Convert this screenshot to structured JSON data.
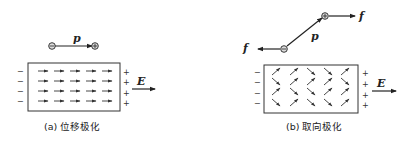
{
  "panels": [
    {
      "id": "a",
      "caption": "(a) 位移极化",
      "dipole_label": "p",
      "field_label": "E",
      "left_charges": [
        "−",
        "−",
        "−",
        "−"
      ],
      "right_charges": [
        "+",
        "+",
        "+",
        "+"
      ],
      "dipole_description": "negative charge on left, positive charge on right, arrow p pointing right",
      "inner_arrows": "4 rows × 5 columns of short arrows all pointing right (aligned with E)"
    },
    {
      "id": "b",
      "caption": "(b) 取向极化",
      "dipole_label": "p",
      "force_label": "f",
      "field_label": "E",
      "left_charges": [
        "−",
        "−",
        "−",
        "−"
      ],
      "right_charges": [
        "+",
        "+",
        "+",
        "+"
      ],
      "dipole_description": "negative charge lower-left, positive charge upper-right, arrow p pointing up-right; force f left on negative charge and right on positive charge",
      "inner_arrows": "4 rows × 5 columns of short tilted arrows in mixed orientations (partially aligned with E)"
    }
  ],
  "colors": {
    "ink": "#222222",
    "background": "#ffffff"
  }
}
